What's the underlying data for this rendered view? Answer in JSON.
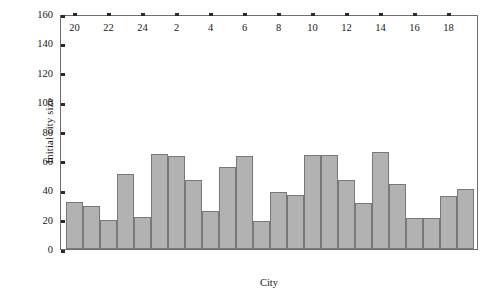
{
  "chart_data": {
    "type": "bar",
    "title": "",
    "xlabel": "City",
    "ylabel": "Initial city size",
    "ylim": [
      0,
      160
    ],
    "yticks": [
      0,
      20,
      40,
      60,
      80,
      100,
      120,
      140,
      160
    ],
    "ytick_labels": [
      "0",
      "20",
      "40",
      "60",
      "80",
      "100",
      "120",
      "140",
      "160"
    ],
    "xtick_labels": [
      "20",
      "22",
      "24",
      "2",
      "4",
      "6",
      "8",
      "10",
      "12",
      "14",
      "16",
      "18"
    ],
    "grid": false,
    "legend": null,
    "categories": [
      "20",
      "21",
      "22",
      "23",
      "24",
      "1",
      "2",
      "3",
      "4",
      "5",
      "6",
      "7",
      "8",
      "9",
      "10",
      "11",
      "12",
      "13",
      "14",
      "15",
      "16",
      "17",
      "18",
      "19"
    ],
    "values": [
      32,
      29,
      20,
      51,
      22,
      65,
      63,
      47,
      26,
      56,
      63,
      19,
      39,
      37,
      64,
      64,
      47,
      31,
      66,
      44,
      21,
      21,
      36,
      41
    ],
    "bar_fill_color": "#b2b2b2",
    "bar_edge_color": "#787878",
    "axis_color": "#6d6d6d"
  }
}
